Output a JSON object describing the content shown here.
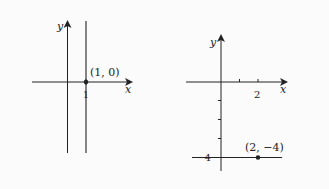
{
  "figure": {
    "left_graph": {
      "axis_x_label": "x",
      "axis_y_label": "y",
      "tick_label": "1",
      "point_label": "(1, 0)",
      "description": "vertical line x = 1"
    },
    "right_graph": {
      "axis_x_label": "x",
      "axis_y_label": "y",
      "x_tick_label": "2",
      "y_tick_label": "−4",
      "point_label": "(2, −4)",
      "description": "horizontal line y = -4"
    }
  },
  "colors": {
    "line": "#222222",
    "background": "#fbfbfb"
  }
}
